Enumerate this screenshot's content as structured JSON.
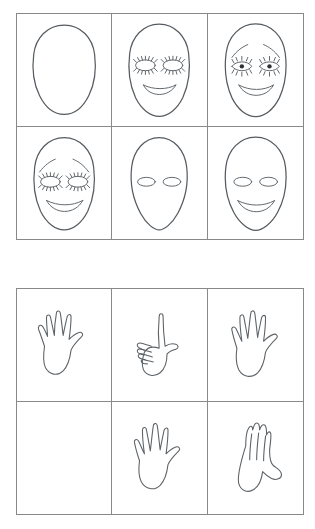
{
  "page": {
    "background_color": "#ffffff",
    "ink_color": "#555b60",
    "grid_border_color": "#888888",
    "width": 315,
    "height": 529
  },
  "grids": [
    {
      "name": "faces-grid",
      "label": "Faces grid",
      "rows": 2,
      "columns": 3,
      "cells": [
        {
          "position": "row1-col1",
          "label": "Blank face outline",
          "features": []
        },
        {
          "position": "row1-col2",
          "label": "Face with closed lashed eyes and smile",
          "features": [
            "closed-eyes",
            "smile"
          ]
        },
        {
          "position": "row1-col3",
          "label": "Face with eyebrows, open eyes with pupils and smile",
          "features": [
            "eyebrows",
            "open-eyes",
            "pupils",
            "smile"
          ]
        },
        {
          "position": "row2-col1",
          "label": "Face with eyebrows, closed lashed eyes and smile",
          "features": [
            "eyebrows",
            "closed-eyes",
            "smile"
          ]
        },
        {
          "position": "row2-col2",
          "label": "Face with plain oval eyes, no mouth",
          "features": [
            "oval-eyes"
          ]
        },
        {
          "position": "row2-col3",
          "label": "Face with plain oval eyes and smile",
          "features": [
            "oval-eyes",
            "smile"
          ]
        }
      ]
    },
    {
      "name": "hands-grid",
      "label": "Hands grid",
      "rows": 2,
      "columns": 3,
      "cells": [
        {
          "position": "row1-col1",
          "label": "Open hand with five spread fingers",
          "features": [
            "open-hand"
          ]
        },
        {
          "position": "row1-col2",
          "label": "Pointing hand with index finger extended",
          "features": [
            "pointing-hand"
          ]
        },
        {
          "position": "row1-col3",
          "label": "Open hand with five spread fingers",
          "features": [
            "open-hand"
          ]
        },
        {
          "position": "row2-col1",
          "label": "Empty cell",
          "features": []
        },
        {
          "position": "row2-col2",
          "label": "Open hand with five spread fingers",
          "features": [
            "open-hand"
          ]
        },
        {
          "position": "row2-col3",
          "label": "Hand with fingers held together and thumb out",
          "features": [
            "flat-hand"
          ]
        }
      ]
    }
  ]
}
